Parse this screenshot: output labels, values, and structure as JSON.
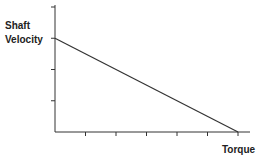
{
  "chart_data": {
    "type": "line",
    "title": "",
    "ylabel": "Shaft Velocity",
    "xlabel": "Torque",
    "ylabel_lines": [
      "Shaft",
      "Velocity"
    ],
    "x_ticks": 6,
    "y_ticks": 4,
    "tick_labels_x": [],
    "tick_labels_y": [],
    "grid": false,
    "legend": null,
    "series": [
      {
        "name": "speed-torque",
        "points": [
          [
            0,
            3
          ],
          [
            6,
            0
          ]
        ]
      }
    ],
    "xlim": [
      0,
      6.4
    ],
    "ylim": [
      0,
      4
    ],
    "annotations": [],
    "colors": {
      "line": "#333333",
      "axis": "#333333",
      "text": "#222222"
    }
  },
  "labels": {
    "y_line1": "Shaft",
    "y_line2": "Velocity",
    "x": "Torque"
  }
}
